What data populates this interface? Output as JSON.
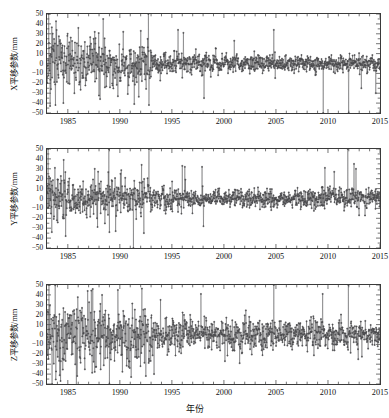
{
  "figure": {
    "background": "#ffffff",
    "axis_color": "#3a3a3a",
    "series_color": "#58585a",
    "marker_color": "#4a4a4c",
    "xlabel": "年份"
  },
  "chart_data": [
    {
      "type": "line",
      "panel_index": 0,
      "title": "",
      "ylabel": "X平移参数/mm",
      "xlabel": "",
      "xlim": [
        1983.0,
        2015.0
      ],
      "ylim": [
        -50,
        50
      ],
      "yticks": [
        50,
        40,
        30,
        20,
        10,
        0,
        -10,
        -20,
        -30,
        -40,
        -50
      ],
      "ytick_labels": [
        "50",
        "40",
        "30",
        "20",
        "10",
        "0",
        "−10",
        "−20",
        "−30",
        "−40",
        "−50"
      ],
      "xticks": [
        1985,
        1990,
        1995,
        2000,
        2005,
        2010,
        2015
      ],
      "xtick_labels": [
        "1985",
        "1990",
        "1995",
        "2000",
        "2005",
        "2010",
        "2015"
      ],
      "grid": false,
      "legend": null,
      "marker": "star",
      "series": [
        {
          "name": "X translation",
          "units": "mm",
          "sampling": "approximately weekly/monthly epochs from 1983.0 to 2015.0",
          "noise_profile": [
            {
              "x_start": 1983.0,
              "x_end": 1985.0,
              "sigma": 16,
              "mean": 2
            },
            {
              "x_start": 1985.0,
              "x_end": 1989.0,
              "sigma": 12,
              "mean": 2
            },
            {
              "x_start": 1989.0,
              "x_end": 1993.0,
              "sigma": 11,
              "mean": -1
            },
            {
              "x_start": 1993.0,
              "x_end": 1997.0,
              "sigma": 6,
              "mean": 0
            },
            {
              "x_start": 1997.0,
              "x_end": 2003.0,
              "sigma": 5,
              "mean": 0
            },
            {
              "x_start": 2003.0,
              "x_end": 2009.0,
              "sigma": 4.5,
              "mean": 0
            },
            {
              "x_start": 2009.0,
              "x_end": 2015.0,
              "sigma": 4,
              "mean": 0
            }
          ],
          "outlier_spikes": [
            {
              "x": 1983.15,
              "y": 50
            },
            {
              "x": 1983.3,
              "y": -43
            },
            {
              "x": 1986.0,
              "y": 36
            },
            {
              "x": 1987.6,
              "y": 32
            },
            {
              "x": 1988.4,
              "y": 45
            },
            {
              "x": 1988.1,
              "y": -36
            },
            {
              "x": 1991.4,
              "y": -41
            },
            {
              "x": 1992.0,
              "y": 33
            },
            {
              "x": 1992.75,
              "y": 50
            },
            {
              "x": 1992.8,
              "y": -42
            },
            {
              "x": 1995.6,
              "y": 34
            },
            {
              "x": 1996.1,
              "y": 31
            },
            {
              "x": 1998.1,
              "y": -35
            },
            {
              "x": 2001.0,
              "y": 23
            },
            {
              "x": 2004.8,
              "y": 34
            },
            {
              "x": 2009.55,
              "y": -50
            },
            {
              "x": 2012.0,
              "y": -50
            },
            {
              "x": 2013.2,
              "y": -25
            },
            {
              "x": 2014.6,
              "y": -30
            }
          ]
        }
      ]
    },
    {
      "type": "line",
      "panel_index": 1,
      "title": "",
      "ylabel": "Y平移参数/mm",
      "xlabel": "",
      "xlim": [
        1983.0,
        2015.0
      ],
      "ylim": [
        -50,
        50
      ],
      "yticks": [
        50,
        40,
        30,
        20,
        10,
        0,
        -10,
        -20,
        -30,
        -40,
        -50
      ],
      "ytick_labels": [
        "50",
        "40",
        "30",
        "20",
        "10",
        "0",
        "−10",
        "−20",
        "−30",
        "−40",
        "−50"
      ],
      "xticks": [
        1985,
        1990,
        1995,
        2000,
        2005,
        2010,
        2015
      ],
      "xtick_labels": [
        "1985",
        "1990",
        "1995",
        "2000",
        "2005",
        "2010",
        "2015"
      ],
      "grid": false,
      "legend": null,
      "marker": "star",
      "series": [
        {
          "name": "Y translation",
          "units": "mm",
          "sampling": "approximately weekly/monthly epochs from 1983.0 to 2015.0",
          "noise_profile": [
            {
              "x_start": 1983.0,
              "x_end": 1985.0,
              "sigma": 13,
              "mean": 1
            },
            {
              "x_start": 1985.0,
              "x_end": 1989.0,
              "sigma": 10,
              "mean": 1
            },
            {
              "x_start": 1989.0,
              "x_end": 1993.0,
              "sigma": 9,
              "mean": 0
            },
            {
              "x_start": 1993.0,
              "x_end": 1997.0,
              "sigma": 6,
              "mean": 0
            },
            {
              "x_start": 1997.0,
              "x_end": 2003.0,
              "sigma": 5,
              "mean": 0
            },
            {
              "x_start": 2003.0,
              "x_end": 2009.0,
              "sigma": 4.5,
              "mean": 0
            },
            {
              "x_start": 2009.0,
              "x_end": 2015.0,
              "sigma": 5,
              "mean": 1
            }
          ],
          "outlier_spikes": [
            {
              "x": 1983.1,
              "y": 50
            },
            {
              "x": 1983.45,
              "y": -34
            },
            {
              "x": 1984.6,
              "y": 39
            },
            {
              "x": 1984.8,
              "y": -38
            },
            {
              "x": 1987.6,
              "y": 30
            },
            {
              "x": 1988.95,
              "y": 50
            },
            {
              "x": 1989.0,
              "y": -34
            },
            {
              "x": 1989.6,
              "y": -33
            },
            {
              "x": 1991.3,
              "y": -50
            },
            {
              "x": 1992.1,
              "y": 34
            },
            {
              "x": 1992.3,
              "y": -35
            },
            {
              "x": 1992.8,
              "y": 50
            },
            {
              "x": 1996.0,
              "y": 33
            },
            {
              "x": 1996.25,
              "y": 32
            },
            {
              "x": 1997.9,
              "y": 32
            },
            {
              "x": 1998.05,
              "y": -28
            },
            {
              "x": 2009.7,
              "y": 31
            },
            {
              "x": 2010.6,
              "y": 27
            },
            {
              "x": 2011.9,
              "y": 50
            },
            {
              "x": 2012.5,
              "y": 35
            },
            {
              "x": 2012.7,
              "y": 30
            },
            {
              "x": 2013.0,
              "y": -17
            }
          ]
        }
      ]
    },
    {
      "type": "line",
      "panel_index": 2,
      "title": "",
      "ylabel": "Z平移参数/mm",
      "xlabel": "年份",
      "xlim": [
        1983.0,
        2015.0
      ],
      "ylim": [
        -50,
        50
      ],
      "yticks": [
        50,
        40,
        30,
        20,
        10,
        0,
        -10,
        -20,
        -30,
        -40,
        -50
      ],
      "ytick_labels": [
        "50",
        "40",
        "30",
        "20",
        "10",
        "0",
        "−10",
        "−20",
        "−30",
        "−40",
        "−50"
      ],
      "xticks": [
        1985,
        1990,
        1995,
        2000,
        2005,
        2010,
        2015
      ],
      "xtick_labels": [
        "1985",
        "1990",
        "1995",
        "2000",
        "2005",
        "2010",
        "2015"
      ],
      "grid": false,
      "legend": null,
      "marker": "star",
      "series": [
        {
          "name": "Z translation",
          "units": "mm",
          "sampling": "approximately weekly/monthly epochs from 1983.0 to 2015.0",
          "noise_profile": [
            {
              "x_start": 1983.0,
              "x_end": 1985.0,
              "sigma": 22,
              "mean": 0
            },
            {
              "x_start": 1985.0,
              "x_end": 1989.0,
              "sigma": 18,
              "mean": 0
            },
            {
              "x_start": 1989.0,
              "x_end": 1993.0,
              "sigma": 15,
              "mean": -2
            },
            {
              "x_start": 1993.0,
              "x_end": 1997.0,
              "sigma": 9,
              "mean": 0
            },
            {
              "x_start": 1997.0,
              "x_end": 2003.0,
              "sigma": 8,
              "mean": 0
            },
            {
              "x_start": 2003.0,
              "x_end": 2009.0,
              "sigma": 7.5,
              "mean": 0
            },
            {
              "x_start": 2009.0,
              "x_end": 2015.0,
              "sigma": 7,
              "mean": 0
            }
          ],
          "outlier_spikes": [
            {
              "x": 1983.2,
              "y": 50
            },
            {
              "x": 1983.5,
              "y": -50
            },
            {
              "x": 1984.3,
              "y": -47
            },
            {
              "x": 1985.9,
              "y": -42
            },
            {
              "x": 1986.9,
              "y": 44
            },
            {
              "x": 1987.4,
              "y": 46
            },
            {
              "x": 1988.3,
              "y": 40
            },
            {
              "x": 1989.0,
              "y": -50
            },
            {
              "x": 1989.8,
              "y": 45
            },
            {
              "x": 1991.1,
              "y": -43
            },
            {
              "x": 1992.5,
              "y": -42
            },
            {
              "x": 1993.3,
              "y": -40
            },
            {
              "x": 1993.9,
              "y": 35
            },
            {
              "x": 1997.8,
              "y": 41
            },
            {
              "x": 2000.1,
              "y": -27
            },
            {
              "x": 2001.5,
              "y": -29
            },
            {
              "x": 2004.8,
              "y": 50
            },
            {
              "x": 2009.5,
              "y": 41
            },
            {
              "x": 2011.95,
              "y": 50
            },
            {
              "x": 2012.9,
              "y": -25
            }
          ]
        }
      ]
    }
  ]
}
